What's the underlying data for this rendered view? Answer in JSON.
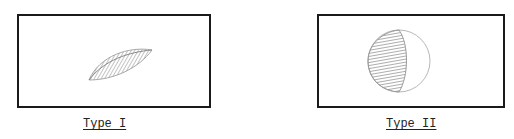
{
  "figures": [
    {
      "id": "type-1",
      "label": "Type I",
      "shape": "lens"
    },
    {
      "id": "type-2",
      "label": "Type II",
      "shape": "half-shaded-circle"
    }
  ],
  "colors": {
    "border": "#1a1a1a",
    "shading": "#9a9a9a",
    "outline": "#b0b0b0"
  }
}
